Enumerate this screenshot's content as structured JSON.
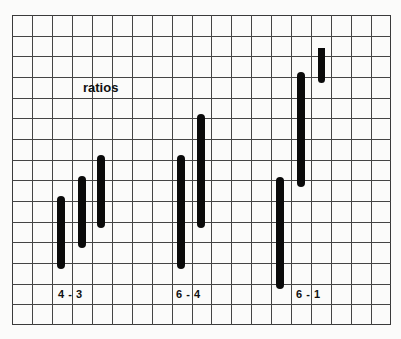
{
  "title": "ratios",
  "grid": {
    "columns": 19,
    "rows": 15,
    "left": 12,
    "top": 15,
    "right": 391,
    "bottom": 325,
    "line_color": "#444444",
    "background": "#fbfbfa"
  },
  "bar_color": "#0a0a0a",
  "groups": [
    {
      "label": "4 - 3",
      "label_pos": {
        "x": 58,
        "y": 289
      },
      "bars": [
        {
          "x": 57,
          "top": 196,
          "bottom": 269
        },
        {
          "x": 78,
          "top": 176,
          "bottom": 248
        },
        {
          "x": 97,
          "top": 155,
          "bottom": 228
        }
      ]
    },
    {
      "label": "6 - 4",
      "label_pos": {
        "x": 176,
        "y": 289
      },
      "bars": [
        {
          "x": 177,
          "top": 155,
          "bottom": 269
        },
        {
          "x": 197,
          "top": 114,
          "bottom": 228
        }
      ]
    },
    {
      "label": "6 - 1",
      "label_pos": {
        "x": 296,
        "y": 289
      },
      "bars": [
        {
          "x": 276,
          "top": 177,
          "bottom": 289
        },
        {
          "x": 297,
          "top": 72,
          "bottom": 187
        },
        {
          "x": 318,
          "top": 48,
          "bottom": 83,
          "flat_top": true
        }
      ]
    }
  ],
  "title_pos": {
    "x": 83,
    "y": 81
  }
}
